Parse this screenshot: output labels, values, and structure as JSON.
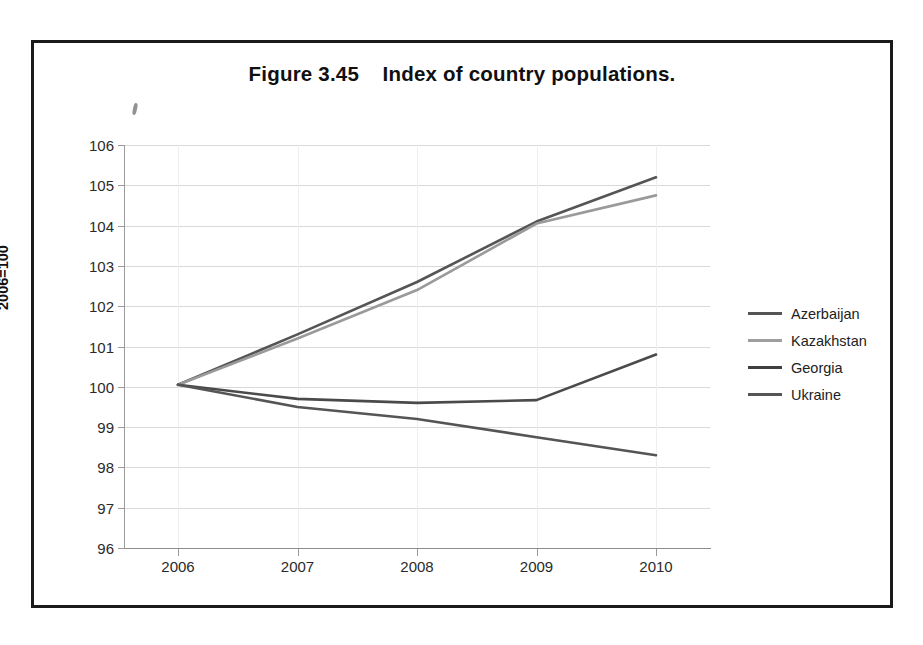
{
  "figure": {
    "title": "Figure 3.45    Index of country populations."
  },
  "chart_data": {
    "type": "line",
    "title": "Figure 3.45    Index of country populations.",
    "xlabel": "",
    "ylabel": "2006=100",
    "categories": [
      "2006",
      "2007",
      "2008",
      "2009",
      "2010"
    ],
    "x": [
      2006,
      2007,
      2008,
      2009,
      2010
    ],
    "ylim": [
      96,
      106
    ],
    "xlim": [
      2005.6,
      2010.4
    ],
    "yticks": [
      96,
      97,
      98,
      99,
      100,
      101,
      102,
      103,
      104,
      105,
      106
    ],
    "grid": true,
    "legend_position": "right",
    "series": [
      {
        "name": "Azerbaijan",
        "color": "#555555",
        "values": [
          100.05,
          101.3,
          102.6,
          104.1,
          105.2
        ]
      },
      {
        "name": "Kazakhstan",
        "color": "#9a9a9a",
        "values": [
          100.05,
          101.2,
          102.4,
          104.05,
          104.75
        ]
      },
      {
        "name": "Georgia",
        "color": "#4a4a4a",
        "values": [
          100.05,
          99.7,
          99.6,
          99.67,
          100.8
        ]
      },
      {
        "name": "Ukraine",
        "color": "#555555",
        "values": [
          100.05,
          99.5,
          99.2,
          98.75,
          98.3
        ]
      }
    ]
  },
  "axes": {
    "y_title": "2006=100",
    "y_tick_labels": [
      "106",
      "105",
      "104",
      "103",
      "102",
      "101",
      "100",
      "99",
      "98",
      "97",
      "96"
    ],
    "x_tick_labels": [
      "2006",
      "2007",
      "2008",
      "2009",
      "2010"
    ]
  },
  "legend": {
    "items": [
      {
        "label": "Azerbaijan",
        "color": "#555555"
      },
      {
        "label": "Kazakhstan",
        "color": "#9e9e9e"
      },
      {
        "label": "Georgia",
        "color": "#3f3f3f"
      },
      {
        "label": "Ukraine",
        "color": "#555555"
      }
    ]
  }
}
